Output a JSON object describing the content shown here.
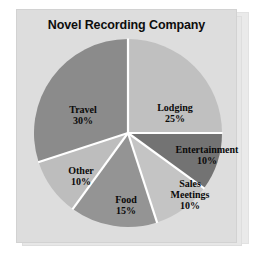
{
  "chart_data": {
    "type": "pie",
    "title": "Novel Recording Company",
    "categories": [
      "Lodging",
      "Entertainment",
      "Sales Meetings",
      "Food",
      "Other",
      "Travel"
    ],
    "values": [
      25,
      10,
      10,
      15,
      10,
      30
    ],
    "unit": "%",
    "start_angle_deg": 0,
    "direction": "clockwise",
    "legend": "none",
    "grid": false,
    "slices": [
      {
        "name": "Lodging",
        "value": 25,
        "label_name": "Lodging",
        "label_value": "25%",
        "color": "#c0c0c0",
        "start_deg": 0,
        "end_deg": 90
      },
      {
        "name": "Entertainment",
        "value": 10,
        "label_name": "Entertainment",
        "label_value": "10%",
        "color": "#737373",
        "start_deg": 90,
        "end_deg": 126
      },
      {
        "name": "Sales Meetings",
        "value": 10,
        "label_name": "Sales",
        "label_name2": "Meetings",
        "label_value": "10%",
        "color": "#c4c4c4",
        "start_deg": 126,
        "end_deg": 162
      },
      {
        "name": "Food",
        "value": 15,
        "label_name": "Food",
        "label_value": "15%",
        "color": "#949494",
        "start_deg": 162,
        "end_deg": 216
      },
      {
        "name": "Other",
        "value": 10,
        "label_name": "Other",
        "label_value": "10%",
        "color": "#bdbdbd",
        "start_deg": 216,
        "end_deg": 252
      },
      {
        "name": "Travel",
        "value": 30,
        "label_name": "Travel",
        "label_value": "30%",
        "color": "#8b8b8b",
        "start_deg": 252,
        "end_deg": 360
      }
    ],
    "colors": {
      "panel_background": "#dddddd",
      "panel_back_background": "#eaeaea",
      "divider": "#ffffff",
      "text": "#0a0a0a",
      "title_text": "#0d0d0d"
    }
  }
}
